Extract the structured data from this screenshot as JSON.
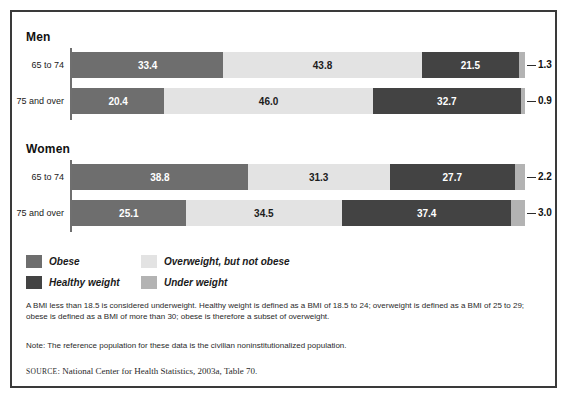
{
  "chart_data": {
    "type": "bar",
    "orientation": "horizontal",
    "stacked": true,
    "title": "",
    "xlabel": "",
    "ylabel": "",
    "xlim": [
      0,
      100
    ],
    "grid": false,
    "legend_position": "below-plot",
    "categories": [
      "Men 65 to 74",
      "Men 75 and over",
      "Women 65 to 74",
      "Women 75 and over"
    ],
    "series": [
      {
        "name": "Obese",
        "values": [
          33.4,
          20.4,
          38.8,
          25.1
        ]
      },
      {
        "name": "Overweight, but not obese",
        "values": [
          43.8,
          46.0,
          31.3,
          34.5
        ]
      },
      {
        "name": "Healthy weight",
        "values": [
          21.5,
          32.7,
          27.7,
          37.4
        ]
      },
      {
        "name": "Under weight",
        "values": [
          1.3,
          0.9,
          2.2,
          3.0
        ]
      }
    ],
    "groups": [
      {
        "title": "Men",
        "rows": [
          {
            "label": "65 to 74",
            "segments": [
              {
                "key": "obese",
                "value": "33.4",
                "pct": 33.4
              },
              {
                "key": "overweight",
                "value": "43.8",
                "pct": 43.8
              },
              {
                "key": "healthy",
                "value": "21.5",
                "pct": 21.5
              },
              {
                "key": "under",
                "value": "1.3",
                "pct": 1.3
              }
            ]
          },
          {
            "label": "75 and over",
            "segments": [
              {
                "key": "obese",
                "value": "20.4",
                "pct": 20.4
              },
              {
                "key": "overweight",
                "value": "46.0",
                "pct": 46.0
              },
              {
                "key": "healthy",
                "value": "32.7",
                "pct": 32.7
              },
              {
                "key": "under",
                "value": "0.9",
                "pct": 0.9
              }
            ]
          }
        ]
      },
      {
        "title": "Women",
        "rows": [
          {
            "label": "65 to 74",
            "segments": [
              {
                "key": "obese",
                "value": "38.8",
                "pct": 38.8
              },
              {
                "key": "overweight",
                "value": "31.3",
                "pct": 31.3
              },
              {
                "key": "healthy",
                "value": "27.7",
                "pct": 27.7
              },
              {
                "key": "under",
                "value": "2.2",
                "pct": 2.2
              }
            ]
          },
          {
            "label": "75 and over",
            "segments": [
              {
                "key": "obese",
                "value": "25.1",
                "pct": 25.1
              },
              {
                "key": "overweight",
                "value": "34.5",
                "pct": 34.5
              },
              {
                "key": "healthy",
                "value": "37.4",
                "pct": 37.4
              },
              {
                "key": "under",
                "value": "3.0",
                "pct": 3.0
              }
            ]
          }
        ]
      }
    ],
    "colors": {
      "obese": "#6e6e6e",
      "overweight": "#e3e3e3",
      "healthy": "#434343",
      "under": "#b3b3b3",
      "border": "#3a3a3a",
      "axis": "#6f6f6f"
    }
  },
  "legend": {
    "items": [
      {
        "key": "obese",
        "label": "Obese"
      },
      {
        "key": "overweight",
        "label": "Overweight, but not obese"
      },
      {
        "key": "healthy",
        "label": "Healthy weight"
      },
      {
        "key": "under",
        "label": "Under weight"
      }
    ]
  },
  "notes": {
    "bmi": "A BMI less than 18.5 is considered underweight. Healthy weight is defined as a BMI of 18.5 to 24; overweight is defined as a BMI of 25 to 29; obese is defined as a BMI of more than 30; obese is therefore a subset of overweight.",
    "reference": "Note: The reference population for these data is the civilian noninstitutionalized population.",
    "source_prefix": "SOURCE",
    "source_text": ": National Center for Health Statistics, 2003a, Table 70."
  }
}
